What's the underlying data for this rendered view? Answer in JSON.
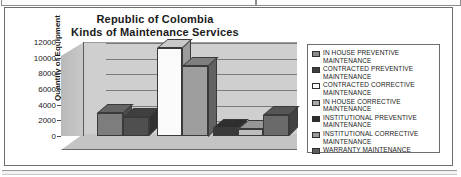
{
  "chart_data": {
    "type": "bar",
    "title": "Republic of Colombia\nKinds of Maintenance Services",
    "title_line1": "Republic of Colombia",
    "title_line2": "Kinds of Maintenance Services",
    "xlabel": "",
    "ylabel": "Quantity of Equipment",
    "ylim": [
      0,
      12000
    ],
    "yticks": [
      12000,
      10000,
      8000,
      6000,
      4000,
      2000,
      0
    ],
    "ytick_labels": [
      "12000",
      "10000",
      "8000",
      "6000",
      "4000",
      "2000",
      "0"
    ],
    "grid": true,
    "legend_position": "right",
    "three_d": true,
    "categories": [
      "IN HOUSE PREVENTIVE MAINTENANCE",
      "CONTRACTED PREVENTIVE MAINTENANCE",
      "CONTRACTED CORRECTIVE MAINTENANCE",
      "IN HOUSE CORRECTIVE MAINTENANCE",
      "INSTITUTIONAL PREVENTIVE MAINTENANCE",
      "INSTITUTIONAL CORRECTIVE MAINTENANCE",
      "WARRANTY MAINTENANCE"
    ],
    "values": [
      2900,
      2400,
      11200,
      9000,
      1000,
      900,
      2700
    ],
    "series": [
      {
        "name": "IN HOUSE PREVENTIVE MAINTENANCE",
        "value": 2900,
        "color": "#7d7d7d"
      },
      {
        "name": "CONTRACTED PREVENTIVE MAINTENANCE",
        "value": 2400,
        "color": "#4f4f4f"
      },
      {
        "name": "CONTRACTED CORRECTIVE MAINTENANCE",
        "value": 11200,
        "color": "#fbfbfb"
      },
      {
        "name": "IN HOUSE CORRECTIVE MAINTENANCE",
        "value": 9000,
        "color": "#9e9e9e"
      },
      {
        "name": "INSTITUTIONAL PREVENTIVE MAINTENANCE",
        "value": 1000,
        "color": "#3a3a3a"
      },
      {
        "name": "INSTITUTIONAL CORRECTIVE MAINTENANCE",
        "value": 900,
        "color": "#bdbdbd"
      },
      {
        "name": "WARRANTY MAINTENANCE",
        "value": 2700,
        "color": "#6a6a6a"
      }
    ]
  },
  "legend": {
    "items": [
      {
        "label_line1": "IN HOUSE PREVENTIVE",
        "label_line2": "MAINTENANCE",
        "color": "#8a8a8a"
      },
      {
        "label_line1": "CONTRACTED PREVENTIVE",
        "label_line2": "MAINTENANCE",
        "color": "#3d3d3d"
      },
      {
        "label_line1": "CONTRACTED CORRECTIVE",
        "label_line2": "MAINTENANCE",
        "color": "#fbfbfb"
      },
      {
        "label_line1": "IN HOUSE CORRECTIVE",
        "label_line2": "MAINTENANCE",
        "color": "#a8a8a8"
      },
      {
        "label_line1": "INSTITUTIONAL PREVENTIVE",
        "label_line2": "MAINTENANCE",
        "color": "#2e2e2e"
      },
      {
        "label_line1": "INSTITUTIONAL CORRECTIVE",
        "label_line2": "MAINTENANCE",
        "color": "#9a9a9a"
      },
      {
        "label_line1": "WARRANTY MAINTENANCE",
        "label_line2": "",
        "color": "#5c5c5c"
      }
    ]
  },
  "colors": {
    "plot_wall": "#cfcfcf",
    "plot_floor": "#c4c4c4",
    "gridline": "#7b7b7b",
    "frame": "#6e6e6e",
    "text": "#1a1a1a"
  }
}
